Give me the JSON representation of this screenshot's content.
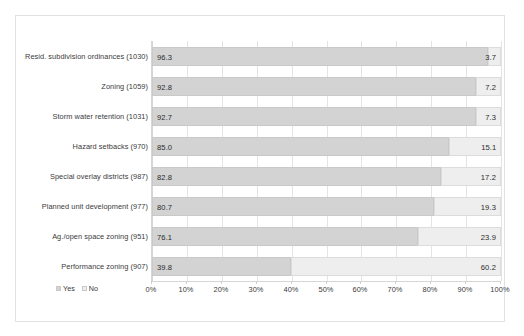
{
  "chart_data": {
    "type": "bar",
    "orientation": "horizontal",
    "stacked": true,
    "stack_total": 100,
    "title": "",
    "subtitle": "",
    "xlabel": "",
    "ylabel": "",
    "xlim": [
      0,
      100
    ],
    "grid": true,
    "legend_position": "bottom-left",
    "tick_labels": [
      "0%",
      "10%",
      "20%",
      "30%",
      "40%",
      "50%",
      "60%",
      "70%",
      "80%",
      "90%",
      "100%"
    ],
    "tick_values": [
      0,
      10,
      20,
      30,
      40,
      50,
      60,
      70,
      80,
      90,
      100
    ],
    "categories": [
      "Resid. subdivision ordinances (1030)",
      "Zoning (1059)",
      "Storm water retention (1031)",
      "Hazard setbacks (970)",
      "Special overlay districts (987)",
      "Planned unit development (977)",
      "Ag./open space zoning (951)",
      "Performance zoning (907)"
    ],
    "series": [
      {
        "name": "Yes",
        "color": "#d3d3d3",
        "values": [
          96.3,
          92.8,
          92.7,
          85.0,
          82.8,
          80.7,
          76.1,
          39.8
        ],
        "labels": [
          "96.3",
          "92.8",
          "92.7",
          "85.0",
          "82.8",
          "80.7",
          "76.1",
          "39.8"
        ]
      },
      {
        "name": "No",
        "color": "#eeeeee",
        "values": [
          3.7,
          7.2,
          7.3,
          15.1,
          17.2,
          19.3,
          23.9,
          60.2
        ],
        "labels": [
          "3.7",
          "7.2",
          "7.3",
          "15.1",
          "17.2",
          "19.3",
          "23.9",
          "60.2"
        ]
      }
    ],
    "legend": [
      {
        "label": "Yes",
        "color": "#d3d3d3"
      },
      {
        "label": "No",
        "color": "#eeeeee"
      }
    ]
  }
}
